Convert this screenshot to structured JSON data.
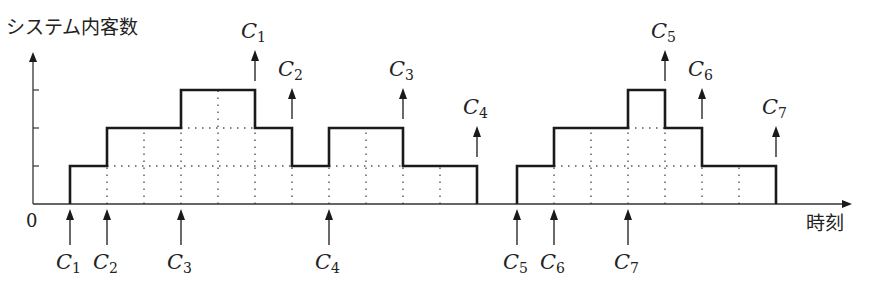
{
  "diagram": {
    "y_axis_label": "システム内客数",
    "x_axis_label": "時刻",
    "origin_label": "0",
    "caption_visible_fragment": "",
    "colors": {
      "line": "#1a1a1a",
      "grid": "#555555",
      "axis": "#333333"
    },
    "geometry": {
      "y_axis_x": 33,
      "baseline_y": 204,
      "y_axis_top": 52,
      "x_axis_end": 852,
      "level_y": [
        204,
        166,
        128,
        90
      ],
      "grid_spacing": 37
    },
    "arrivals": [
      {
        "name": "C",
        "sub": "1",
        "x": 70
      },
      {
        "name": "C",
        "sub": "2",
        "x": 107
      },
      {
        "name": "C",
        "sub": "3",
        "x": 181
      },
      {
        "name": "C",
        "sub": "4",
        "x": 329
      },
      {
        "name": "C",
        "sub": "5",
        "x": 517
      },
      {
        "name": "C",
        "sub": "6",
        "x": 554
      },
      {
        "name": "C",
        "sub": "7",
        "x": 628
      }
    ],
    "departures": [
      {
        "name": "C",
        "sub": "1",
        "x": 255,
        "level": 3
      },
      {
        "name": "C",
        "sub": "2",
        "x": 292,
        "level": 2
      },
      {
        "name": "C",
        "sub": "3",
        "x": 403,
        "level": 2
      },
      {
        "name": "C",
        "sub": "4",
        "x": 477,
        "level": 1
      },
      {
        "name": "C",
        "sub": "5",
        "x": 665,
        "level": 3
      },
      {
        "name": "C",
        "sub": "6",
        "x": 702,
        "level": 2
      },
      {
        "name": "C",
        "sub": "7",
        "x": 776,
        "level": 1
      }
    ],
    "step_groups": [
      {
        "points": [
          [
            70,
            0
          ],
          [
            70,
            1
          ],
          [
            107,
            1
          ],
          [
            107,
            2
          ],
          [
            181,
            2
          ],
          [
            181,
            3
          ],
          [
            255,
            3
          ],
          [
            255,
            2
          ],
          [
            292,
            2
          ],
          [
            292,
            1
          ],
          [
            329,
            1
          ],
          [
            329,
            2
          ],
          [
            403,
            2
          ],
          [
            403,
            1
          ],
          [
            477,
            1
          ],
          [
            477,
            0
          ]
        ],
        "grid_x": [
          107,
          144,
          181,
          218,
          255,
          292,
          329,
          366,
          403,
          440
        ]
      },
      {
        "points": [
          [
            517,
            0
          ],
          [
            517,
            1
          ],
          [
            554,
            1
          ],
          [
            554,
            2
          ],
          [
            628,
            2
          ],
          [
            628,
            3
          ],
          [
            665,
            3
          ],
          [
            665,
            2
          ],
          [
            702,
            2
          ],
          [
            702,
            1
          ],
          [
            776,
            1
          ],
          [
            776,
            0
          ]
        ],
        "grid_x": [
          554,
          591,
          628,
          665,
          702,
          739
        ]
      }
    ]
  }
}
